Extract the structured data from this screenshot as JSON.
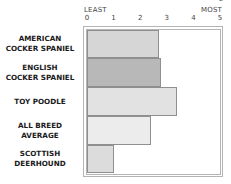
{
  "chart_data": {
    "type": "bar",
    "orientation": "horizontal",
    "title": "",
    "xlabel": "",
    "ylabel": "",
    "axis_end_labels": {
      "left": "LEAST",
      "right": "MOST"
    },
    "x_ticks": [
      "0",
      "1",
      "2",
      "3",
      "4",
      "5"
    ],
    "xlim": [
      0,
      5
    ],
    "grid": false,
    "categories": [
      "AMERICAN COCKER SPANIEL",
      "ENGLISH COCKER SPANIEL",
      "TOY POODLE",
      "ALL BREED AVERAGE",
      "SCOTTISH DEERHOUND"
    ],
    "values": [
      2.7,
      2.8,
      3.4,
      2.4,
      1.0
    ],
    "bar_colors": [
      "#d6d6d6",
      "#b8b8b8",
      "#e2e2e2",
      "#ececec",
      "#dcdcdc"
    ]
  },
  "labels": [
    [
      "AMERICAN",
      "COCKER SPANIEL"
    ],
    [
      "ENGLISH",
      "COCKER SPANIEL"
    ],
    [
      "TOY POODLE"
    ],
    [
      "ALL BREED",
      "AVERAGE"
    ],
    [
      "SCOTTISH",
      "DEERHOUND"
    ]
  ]
}
